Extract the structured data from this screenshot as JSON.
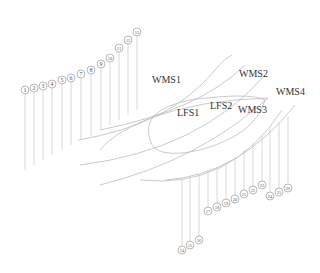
{
  "diagram": {
    "region_labels": [
      {
        "id": "WMS1",
        "text": "WMS1",
        "x": 152,
        "y": 75
      },
      {
        "id": "WMS2",
        "text": "WMS2",
        "x": 239,
        "y": 69
      },
      {
        "id": "WMS4",
        "text": "WMS4",
        "x": 276,
        "y": 87
      },
      {
        "id": "LFS1",
        "text": "LFS1",
        "x": 177,
        "y": 108
      },
      {
        "id": "LFS2",
        "text": "LFS2",
        "x": 210,
        "y": 101
      },
      {
        "id": "WMS3",
        "text": "WMS3",
        "x": 238,
        "y": 105
      }
    ],
    "markers_upper_left": [
      {
        "n": "1",
        "x": 25,
        "y": 90,
        "bottom": 170
      },
      {
        "n": "2",
        "x": 34,
        "y": 88,
        "bottom": 165
      },
      {
        "n": "3",
        "x": 43,
        "y": 86,
        "bottom": 160
      },
      {
        "n": "4",
        "x": 52,
        "y": 84,
        "bottom": 155
      },
      {
        "n": "5",
        "x": 62,
        "y": 80,
        "bottom": 150
      },
      {
        "n": "6",
        "x": 71,
        "y": 78,
        "bottom": 145
      },
      {
        "n": "7",
        "x": 81,
        "y": 74,
        "bottom": 140
      },
      {
        "n": "8",
        "x": 91,
        "y": 70,
        "bottom": 136
      },
      {
        "n": "9",
        "x": 101,
        "y": 64,
        "bottom": 130
      },
      {
        "n": "10",
        "x": 110,
        "y": 58,
        "bottom": 125
      },
      {
        "n": "11",
        "x": 119,
        "y": 48,
        "bottom": 120
      },
      {
        "n": "12",
        "x": 128,
        "y": 40,
        "bottom": 115
      },
      {
        "n": "13",
        "x": 137,
        "y": 32,
        "bottom": 110
      }
    ],
    "markers_lower_bottom": [
      {
        "n": "14",
        "x": 182,
        "y": 250,
        "top": 178
      },
      {
        "n": "15",
        "x": 190,
        "y": 245,
        "top": 176
      },
      {
        "n": "16",
        "x": 199,
        "y": 240,
        "top": 174
      }
    ],
    "markers_lower_middle": [
      {
        "n": "17",
        "x": 208,
        "y": 211,
        "top": 170
      },
      {
        "n": "18",
        "x": 217,
        "y": 207,
        "top": 167
      },
      {
        "n": "19",
        "x": 226,
        "y": 203,
        "top": 163
      },
      {
        "n": "20",
        "x": 235,
        "y": 199,
        "top": 157
      },
      {
        "n": "21",
        "x": 244,
        "y": 194,
        "top": 150
      },
      {
        "n": "22",
        "x": 253,
        "y": 190,
        "top": 143
      },
      {
        "n": "23",
        "x": 262,
        "y": 185,
        "top": 136
      }
    ],
    "markers_lower_right": [
      {
        "n": "24",
        "x": 270,
        "y": 196,
        "top": 128
      },
      {
        "n": "25",
        "x": 279,
        "y": 192,
        "top": 122
      },
      {
        "n": "26",
        "x": 288,
        "y": 188,
        "top": 116
      }
    ],
    "colors": {
      "line": "#bdbdbd",
      "text": "#333333",
      "marker_stroke": "#888888"
    }
  }
}
